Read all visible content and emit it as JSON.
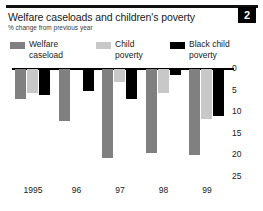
{
  "badge": {
    "number": "2"
  },
  "header": {
    "title": "Welfare caseloads and children's poverty",
    "subtitle": "% change from previous year"
  },
  "legend": {
    "entries": [
      {
        "label": "Welfare\ncaseload",
        "color": "#808080",
        "key": "welfare-caseload"
      },
      {
        "label": "Child\npoverty",
        "color": "#c8c8c8",
        "key": "child-poverty"
      },
      {
        "label": "Black child\npoverty",
        "color": "#000000",
        "key": "black-child-poverty"
      }
    ]
  },
  "chart_data": {
    "type": "bar",
    "title": "Welfare caseloads and children's poverty",
    "subtitle": "% change from previous year",
    "xlabel": "",
    "ylabel": "% change from previous year",
    "categories": [
      "1995",
      "96",
      "97",
      "98",
      "99"
    ],
    "series": [
      {
        "name": "Welfare caseload",
        "color": "#808080",
        "values": [
          -7.0,
          -12.0,
          -20.5,
          -19.5,
          -20.0
        ]
      },
      {
        "name": "Child poverty",
        "color": "#c8c8c8",
        "values": [
          -5.5,
          0.0,
          -3.0,
          -5.5,
          -11.5
        ]
      },
      {
        "name": "Black child poverty",
        "color": "#000000",
        "values": [
          -6.0,
          -5.0,
          -7.0,
          -1.5,
          -10.8
        ]
      }
    ],
    "ylim": [
      -25,
      0
    ],
    "yticks": [
      0,
      5,
      10,
      15,
      20,
      25
    ],
    "ytick_labels": [
      "0",
      "5",
      "10",
      "15",
      "20",
      "25"
    ],
    "y_axis_side": "right",
    "y_axis_inverted": true,
    "grid": false,
    "legend_position": "top"
  }
}
